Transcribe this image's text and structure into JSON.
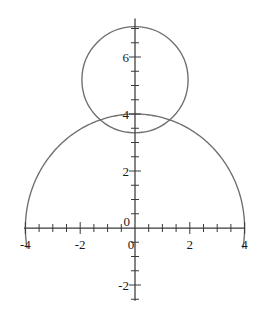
{
  "figure": {
    "background_color": "#ffffff",
    "axis_color": "#3a3a3a",
    "curve_color": "#6e6e6e",
    "label_color": "#1a1a1a",
    "width": 260,
    "height": 310
  },
  "chart_data": {
    "type": "line",
    "title": "",
    "subtitle": "",
    "xlabel": "",
    "ylabel": "",
    "grid": false,
    "legend": "none",
    "xlim": [
      -4.05,
      4.0
    ],
    "ylim": [
      -2.55,
      7.35
    ],
    "x_ticks_major": [
      -4,
      -2,
      0,
      2,
      4
    ],
    "x_tick_labels": [
      "-4",
      "-2",
      "0",
      "2",
      "4"
    ],
    "y_ticks_major": [
      -2,
      0,
      2,
      4,
      6
    ],
    "y_tick_labels": [
      "-2",
      "0",
      "2",
      "4",
      "6"
    ],
    "x_tick_minor_step": 0.5,
    "y_tick_minor_step": 0.5,
    "annotations": [],
    "series": [
      {
        "name": "small-circle",
        "shape": "circle",
        "center": [
          0,
          5.2
        ],
        "radius": 1.9,
        "closed": true,
        "color": "#6e6e6e"
      },
      {
        "name": "large-arc",
        "shape": "arc",
        "center": [
          0,
          0
        ],
        "radius": 4,
        "start_angle_deg": -10,
        "end_angle_deg": 190,
        "closed": false,
        "color": "#6e6e6e"
      }
    ]
  },
  "axes": {
    "x_axis_name": "horizontal-axis",
    "y_axis_name": "vertical-axis",
    "origin_label": "0"
  }
}
